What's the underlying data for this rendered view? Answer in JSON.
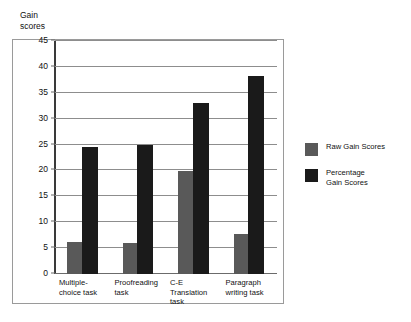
{
  "chart_data": {
    "type": "bar",
    "title": "",
    "xlabel": "",
    "ylabel": "Gain\nscores",
    "ylim": [
      0,
      45
    ],
    "ytick_step": 5,
    "yticks": [
      45,
      40,
      35,
      30,
      25,
      20,
      15,
      10,
      5,
      0
    ],
    "grid": true,
    "legend_position": "right",
    "categories": [
      "Multiple-\nchoice task",
      "Proofreading\ntask",
      "C-E Translation\ntask",
      "Paragraph\nwriting task"
    ],
    "series": [
      {
        "name": "Raw Gain Scores",
        "color": "#595959",
        "values": [
          6.2,
          5.9,
          19.8,
          7.8
        ]
      },
      {
        "name": "Percentage\nGain Scores",
        "color": "#1a1a1a",
        "values": [
          24.5,
          24.9,
          33.0,
          38.2
        ]
      }
    ]
  },
  "legend": {
    "items": [
      {
        "label": "Raw Gain Scores",
        "color": "#595959"
      },
      {
        "label": "Percentage\nGain Scores",
        "color": "#1a1a1a"
      }
    ]
  },
  "colors": {
    "raw_gain": "#595959",
    "percentage_gain": "#1a1a1a",
    "grid": "#8d8d8d",
    "frame": "#9a9a9a",
    "axis": "#3a3a3a"
  }
}
